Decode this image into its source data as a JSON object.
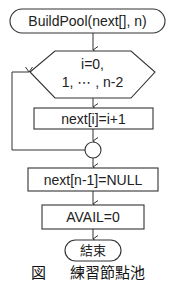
{
  "flowchart": {
    "start": {
      "label": "BuildPool(next[], n)"
    },
    "loop": {
      "line1": "i=0,",
      "line2": "1, ⋯ , n-2"
    },
    "loop_body": {
      "label": "next[i]=i+1"
    },
    "step_null": {
      "label": "next[n-1]=NULL"
    },
    "step_avail": {
      "label": "AVAIL=0"
    },
    "end": {
      "label": "結束"
    }
  },
  "caption": {
    "text": "図     練習節點池"
  },
  "colors": {
    "stroke": "#333333",
    "background": "#ffffff"
  }
}
